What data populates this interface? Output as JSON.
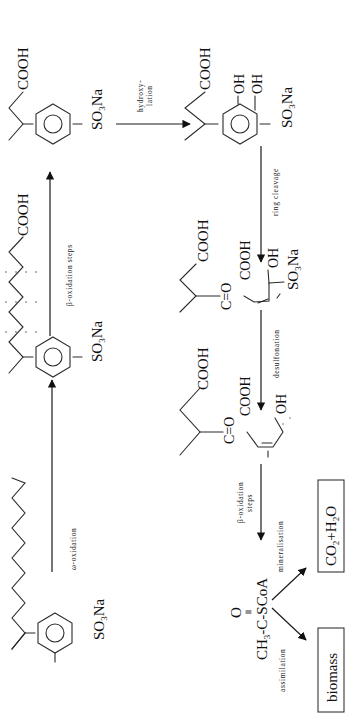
{
  "diagram": {
    "title": "",
    "orientation": "rotated-90-ccw",
    "compounds": {
      "las": {
        "substituent": "SO3Na",
        "description": "linear alkylbenzene sulfonate"
      },
      "carboxylate_long": {
        "acid": "COOH",
        "substituent": "SO3Na"
      },
      "carboxylate_short": {
        "acid": "COOH",
        "substituent": "SO3Na"
      },
      "catechol": {
        "acid": "COOH",
        "oh1": "OH",
        "oh2": "OH",
        "substituent": "SO3Na"
      },
      "ring_cleaved": {
        "acid": "COOH",
        "keto": "C=O",
        "acid2": "COOH",
        "oh": "OH",
        "substituent": "SO3Na"
      },
      "desulfonated": {
        "acid": "COOH",
        "keto": "C=O",
        "acid2": "COOH",
        "oh": "OH"
      },
      "acetyl_coa": {
        "oxygen": "O",
        "formula": "CH3-C-SCoA"
      }
    },
    "steps": {
      "omega_oxidation": "ω-oxidation",
      "beta_oxidation": "β-oxidation steps",
      "hydroxylation_line1": "hydroxy-",
      "hydroxylation_line2": "lation",
      "ring_cleavage": "ring cleavage",
      "desulfonation": "desulfonation",
      "beta_oxidation2_line1": "β-oxidation",
      "beta_oxidation2_line2": "steps",
      "mineralisation": "mineralisation",
      "assimilation": "assimilation"
    },
    "products": {
      "mineral": "CO2+H2O",
      "biomass": "biomass"
    },
    "text": {
      "so3na_main": "SO",
      "so3na_sub": "3",
      "so3na_tail": "Na",
      "cooh": "COOH",
      "oh": "OH",
      "co": "C=O",
      "o": "O",
      "ch": "CH",
      "ch_sub": "3",
      "ch_tail": "-C-SCoA",
      "co2_a": "CO",
      "co2_sub": "2",
      "co2_b": "+H",
      "h2o_sub": "2",
      "h2o_c": "O"
    }
  }
}
